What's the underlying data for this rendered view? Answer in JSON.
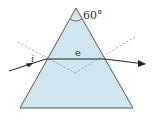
{
  "diagram": {
    "apex_angle_label": "60°",
    "incidence_label": "i",
    "internal_ray_label": "e",
    "colors": {
      "prism_fill": "#cfe6f1",
      "prism_edge": "#555555",
      "ray": "#222222",
      "normal": "#888888"
    }
  }
}
